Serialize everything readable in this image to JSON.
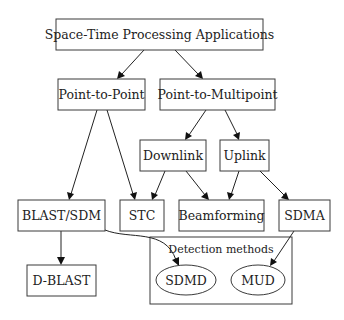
{
  "diagram": {
    "type": "tree",
    "nodes": {
      "root": "Space-Time Processing Applications",
      "p2p": "Point-to-Point",
      "p2mp": "Point-to-Multipoint",
      "downlink": "Downlink",
      "uplink": "Uplink",
      "blast": "BLAST/SDM",
      "stc": "STC",
      "beam": "Beamforming",
      "sdma": "SDMA",
      "dblast": "D-BLAST",
      "sdmd": "SDMD",
      "mud": "MUD"
    },
    "cluster": {
      "label": "Detection methods"
    },
    "edges": [
      {
        "from": "Space-Time Processing Applications",
        "to": "Point-to-Point"
      },
      {
        "from": "Space-Time Processing Applications",
        "to": "Point-to-Multipoint"
      },
      {
        "from": "Point-to-Point",
        "to": "BLAST/SDM"
      },
      {
        "from": "Point-to-Point",
        "to": "STC"
      },
      {
        "from": "Point-to-Multipoint",
        "to": "Downlink"
      },
      {
        "from": "Point-to-Multipoint",
        "to": "Uplink"
      },
      {
        "from": "Downlink",
        "to": "STC"
      },
      {
        "from": "Downlink",
        "to": "Beamforming"
      },
      {
        "from": "Uplink",
        "to": "Beamforming"
      },
      {
        "from": "Uplink",
        "to": "SDMA"
      },
      {
        "from": "BLAST/SDM",
        "to": "D-BLAST"
      },
      {
        "from": "BLAST/SDM",
        "to": "SDMD"
      },
      {
        "from": "SDMA",
        "to": "MUD"
      }
    ]
  }
}
